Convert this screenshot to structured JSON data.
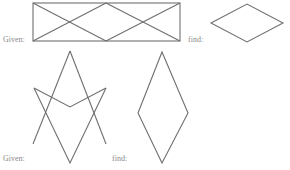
{
  "labels": {
    "given_top": "Given:",
    "find_top": "find:",
    "given_bottom": "Given:",
    "find_bottom": "find:"
  },
  "colors": {
    "stroke": "#6f6f6f",
    "label": "#8a8a8a",
    "background": "#ffffff"
  },
  "figures": {
    "given_top": {
      "description": "Rectangle subdivided by two X-shaped crossings (zigzag diagonals)",
      "rect": [
        33,
        3,
        180,
        41
      ],
      "diagonals": [
        [
          [
            33,
            41
          ],
          [
            106,
            3
          ]
        ],
        [
          [
            33,
            3
          ],
          [
            106,
            41
          ]
        ],
        [
          [
            106,
            3
          ],
          [
            180,
            41
          ]
        ],
        [
          [
            106,
            41
          ],
          [
            180,
            3
          ]
        ]
      ]
    },
    "find_top": {
      "description": "Horizontal rhombus",
      "points": [
        [
          211,
          23
        ],
        [
          247,
          4
        ],
        [
          283,
          23
        ],
        [
          247,
          42
        ]
      ]
    },
    "given_bottom": {
      "description": "Interlocking open chevrons forming a star-like figure",
      "lines": [
        [
          [
            70,
            51
          ],
          [
            33,
            144
          ]
        ],
        [
          [
            70,
            51
          ],
          [
            106,
            144
          ]
        ],
        [
          [
            34,
            88
          ],
          [
            70,
            107
          ]
        ],
        [
          [
            70,
            107
          ],
          [
            106,
            88
          ]
        ],
        [
          [
            34,
            88
          ],
          [
            70,
            163
          ]
        ],
        [
          [
            106,
            88
          ],
          [
            70,
            163
          ]
        ]
      ]
    },
    "find_bottom": {
      "description": "Tall vertical rhombus",
      "points": [
        [
          162,
          52
        ],
        [
          138,
          113
        ],
        [
          188,
          113
        ],
        [
          162,
          163
        ]
      ]
    }
  }
}
